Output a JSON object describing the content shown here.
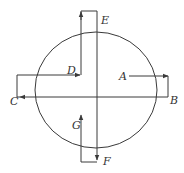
{
  "diagram": {
    "type": "circle with crossed axes and bracketed arrows",
    "colors": {
      "stroke": "#3a3a3a",
      "label": "#333333",
      "background": "#ffffff"
    },
    "labels": {
      "A": "A",
      "B": "B",
      "C": "C",
      "D": "D",
      "E": "E",
      "F": "F",
      "G": "G"
    },
    "elements": [
      {
        "name": "circle",
        "description": "large circle centered on the cross"
      },
      {
        "name": "horizontal-axis",
        "description": "line from B through center to C (arrow at C)"
      },
      {
        "name": "vertical-axis",
        "description": "line from E through center to F (arrow at F)"
      },
      {
        "name": "arrow-A",
        "description": "from A pointing right, bracket down to B"
      },
      {
        "name": "arrow-D",
        "description": "from C bracket up, pointing right to D"
      },
      {
        "name": "arrow-E",
        "description": "from D up to top, bracket right to E"
      },
      {
        "name": "arrow-G",
        "description": "from F bracket left, pointing up to G"
      }
    ]
  }
}
